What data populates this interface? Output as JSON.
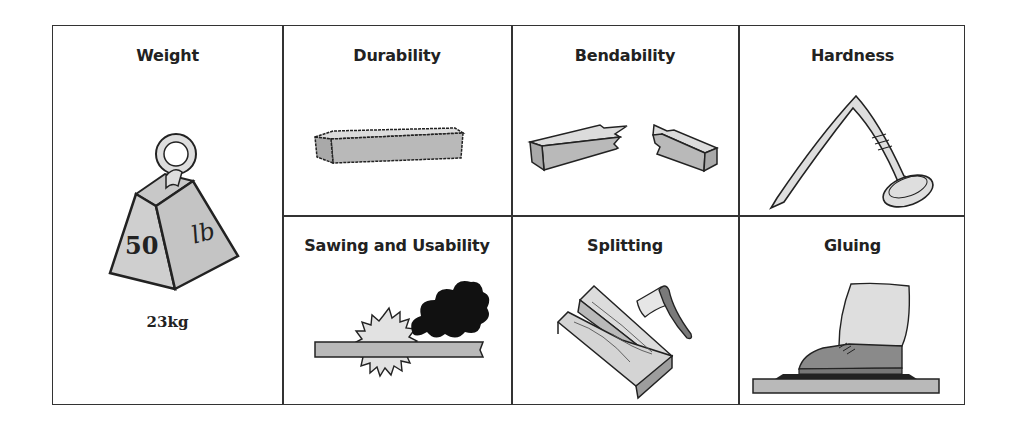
{
  "diagram": {
    "cells": [
      {
        "id": "weight",
        "title": "Weight",
        "caption": "23kg",
        "icon": "weight-icon",
        "weight_labels": {
          "front": "50",
          "side": "lb"
        }
      },
      {
        "id": "durability",
        "title": "Durability",
        "icon": "wood-plank-icon"
      },
      {
        "id": "bendability",
        "title": "Bendability",
        "icon": "broken-plank-icon"
      },
      {
        "id": "hardness",
        "title": "Hardness",
        "icon": "bent-nail-icon"
      },
      {
        "id": "sawing",
        "title": "Sawing and Usability",
        "icon": "saw-blade-smoke-icon"
      },
      {
        "id": "splitting",
        "title": "Splitting",
        "icon": "split-log-axe-icon"
      },
      {
        "id": "gluing",
        "title": "Gluing",
        "icon": "shoe-pressing-board-icon"
      }
    ],
    "colors": {
      "border": "#333333",
      "fill_gray": "#b9b9b9",
      "fill_light": "#dedede",
      "smoke": "#111111",
      "text": "#222222"
    }
  }
}
